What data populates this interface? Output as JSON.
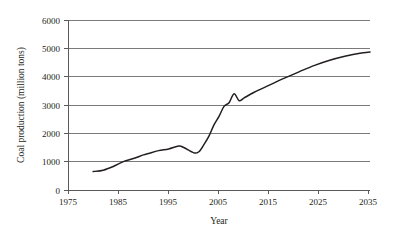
{
  "chart_data": {
    "type": "line",
    "title": "",
    "xlabel": "Year",
    "ylabel": "Coal production (million tons)",
    "xlim": [
      1975,
      2035
    ],
    "ylim": [
      0,
      6000
    ],
    "grid": true,
    "legend": null,
    "xticks": [
      "1975",
      "1985",
      "1995",
      "2005",
      "2015",
      "2025",
      "2035"
    ],
    "xtick_values": [
      1975,
      1985,
      1995,
      2005,
      2015,
      2025,
      2035
    ],
    "yticks": [
      "0",
      "1000",
      "2000",
      "3000",
      "4000",
      "5000",
      "6000"
    ],
    "ytick_values": [
      0,
      1000,
      2000,
      3000,
      4000,
      5000,
      6000
    ],
    "series": [
      {
        "name": "Coal production",
        "color": "#231f20",
        "x": [
          1980,
          1982,
          1984,
          1986,
          1988,
          1990,
          1991,
          1993,
          1995,
          1997,
          1998,
          2000,
          2001,
          2002,
          2003,
          2004,
          2005,
          2006,
          2007,
          2008,
          2009,
          2010,
          2012,
          2015,
          2018,
          2021,
          2024,
          2027,
          2030,
          2033,
          2035
        ],
        "values": [
          650,
          700,
          830,
          1000,
          1110,
          1240,
          1290,
          1390,
          1450,
          1550,
          1500,
          1310,
          1350,
          1600,
          1900,
          2300,
          2600,
          2950,
          3080,
          3400,
          3150,
          3250,
          3450,
          3700,
          3950,
          4180,
          4400,
          4580,
          4720,
          4830,
          4870
        ]
      }
    ]
  },
  "axis": {
    "ylabel": "Coal production (million tons)",
    "xlabel": "Year"
  }
}
